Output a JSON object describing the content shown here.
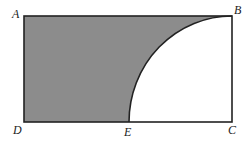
{
  "diagram": {
    "type": "geometry",
    "colors": {
      "shade": "#8c8c8c",
      "stroke": "#222222",
      "background": "#ffffff"
    },
    "points": {
      "A": {
        "label": "A",
        "x": 24,
        "y": 16
      },
      "B": {
        "label": "B",
        "x": 232,
        "y": 16
      },
      "C": {
        "label": "C",
        "x": 232,
        "y": 122
      },
      "D": {
        "label": "D",
        "x": 24,
        "y": 122
      },
      "E": {
        "label": "E",
        "x": 129,
        "y": 122
      }
    },
    "labels": {
      "A": "A",
      "B": "B",
      "C": "C",
      "D": "D",
      "E": "E"
    }
  }
}
